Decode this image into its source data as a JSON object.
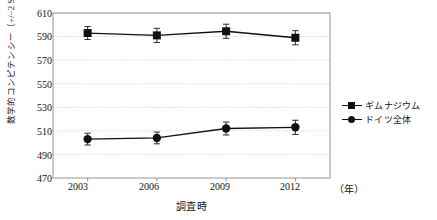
{
  "chart_data": {
    "type": "line",
    "title": "",
    "xlabel": "調査時",
    "ylabel": "数学的コンピテンシー（+/−2 SE）",
    "x_unit_label": "（年）",
    "categories": [
      "2003",
      "2006",
      "2009",
      "2012"
    ],
    "x_values": [
      2003,
      2006,
      2009,
      2012
    ],
    "ylim": [
      470,
      610
    ],
    "yticks": [
      470,
      490,
      510,
      530,
      550,
      570,
      590,
      610
    ],
    "grid": "horizontal-dotted",
    "legend_position": "right",
    "series": [
      {
        "name": "ギムナジウム",
        "marker": "square",
        "color": "#111111",
        "values": [
          593,
          591,
          594.5,
          589
        ],
        "errors": [
          5.5,
          6,
          6,
          6
        ]
      },
      {
        "name": "ドイツ全体",
        "marker": "circle",
        "color": "#111111",
        "values": [
          503,
          504,
          512,
          513
        ],
        "errors": [
          5,
          5,
          5.5,
          6
        ]
      }
    ]
  },
  "axis": {
    "y_label": "数学的コンピテンシー（+/−2 SE）",
    "x_label": "調査時",
    "x_unit": "（年）",
    "y_ticks": [
      "610",
      "590",
      "570",
      "550",
      "530",
      "510",
      "490",
      "470"
    ],
    "x_ticks": [
      "2003",
      "2006",
      "2009",
      "2012"
    ]
  },
  "legend": {
    "items": [
      {
        "label": "ギムナジウム",
        "marker": "square-marker-icon"
      },
      {
        "label": "ドイツ全体",
        "marker": "circle-marker-icon"
      }
    ]
  }
}
